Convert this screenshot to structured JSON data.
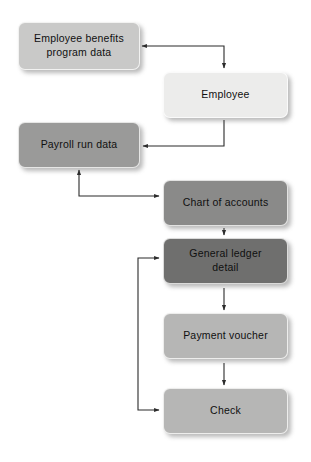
{
  "diagram": {
    "type": "flowchart",
    "canvas": {
      "width": 311,
      "height": 462,
      "background": "#ffffff"
    },
    "palette": {
      "lightest": "#ececeb",
      "light": "#c9c9c8",
      "mid": "#b6b6b5",
      "medium": "#9a9a99",
      "dark": "#8a8a89",
      "darkest": "#6f6f6e",
      "connector": "#2b2b2b",
      "text": "#101010"
    },
    "nodes": [
      {
        "id": "employee-benefits-program-data",
        "label": "Employee benefits\nprogram data",
        "tone": "light",
        "x": 18,
        "y": 22,
        "w": 122,
        "h": 48
      },
      {
        "id": "employee",
        "label": "Employee",
        "tone": "lightest",
        "x": 163,
        "y": 72,
        "w": 125,
        "h": 46
      },
      {
        "id": "payroll-run-data",
        "label": "Payroll run data",
        "tone": "medium",
        "x": 18,
        "y": 122,
        "w": 122,
        "h": 46
      },
      {
        "id": "chart-of-accounts",
        "label": "Chart of accounts",
        "tone": "dark",
        "x": 163,
        "y": 180,
        "w": 125,
        "h": 46
      },
      {
        "id": "general-ledger-detail",
        "label": "General ledger\ndetail",
        "tone": "darkest",
        "x": 163,
        "y": 238,
        "w": 125,
        "h": 46
      },
      {
        "id": "payment-voucher",
        "label": "Payment voucher",
        "tone": "mid",
        "x": 163,
        "y": 313,
        "w": 125,
        "h": 46
      },
      {
        "id": "check",
        "label": "Check",
        "tone": "mid",
        "x": 163,
        "y": 388,
        "w": 125,
        "h": 46
      }
    ],
    "connectors": [
      {
        "id": "employee-to-employee-benefits",
        "from": "employee-benefits-program-data",
        "to": "employee",
        "arrow_direction": "left-and-down",
        "note": "elbow: right of benefits box at y=46, across to x=224, down into Employee top; arrowhead at benefits box right edge"
      },
      {
        "id": "employee-to-payroll-run-data",
        "from": "employee",
        "to": "payroll-run-data",
        "arrow_direction": "left",
        "note": "from Employee bottom at x=224 down to y=146, left to Payroll right edge"
      },
      {
        "id": "payroll-and-chart-of-accounts",
        "from": "chart-of-accounts",
        "to": "payroll-run-data",
        "arrow_direction": "up-and-right",
        "note": "elbow at x=79 y=196; arrowhead up into Payroll bottom and right into Chart of accounts left"
      },
      {
        "id": "chart-of-accounts-to-general-ledger",
        "from": "chart-of-accounts",
        "to": "general-ledger-detail",
        "arrow_direction": "down"
      },
      {
        "id": "general-ledger-to-payment-voucher",
        "from": "general-ledger-detail",
        "to": "payment-voucher",
        "arrow_direction": "down"
      },
      {
        "id": "payment-voucher-to-check",
        "from": "payment-voucher",
        "to": "check",
        "arrow_direction": "down"
      },
      {
        "id": "feedback-loop-general-ledger-check",
        "from": "check",
        "to": "general-ledger-detail",
        "arrow_direction": "right-both-ends",
        "note": "vertical spine at x=138 from y=258 to y=410, arrowheads right into General ledger detail and into Check"
      }
    ]
  }
}
